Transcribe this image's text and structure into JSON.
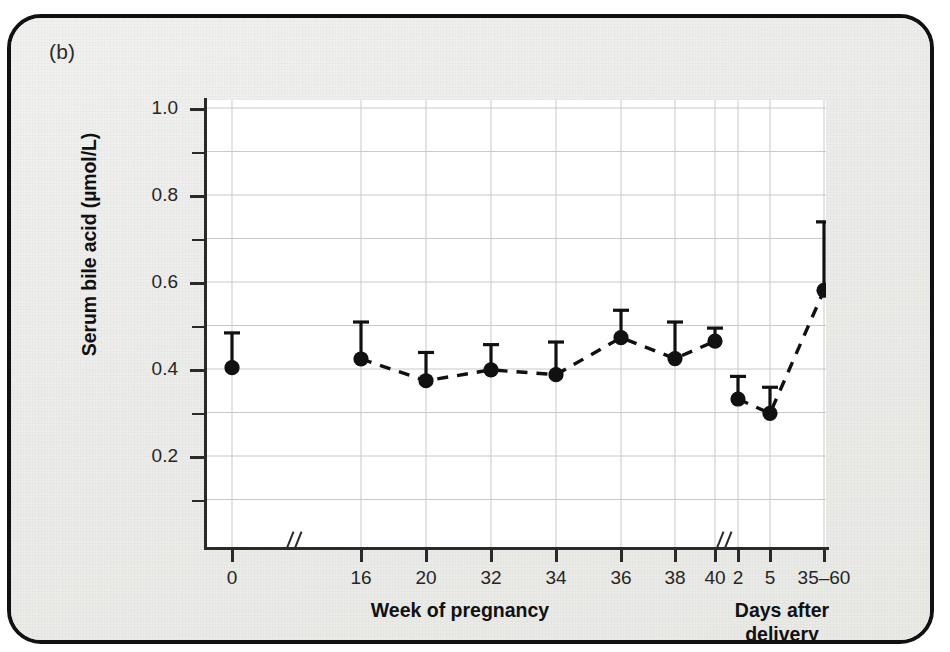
{
  "figure": {
    "panel_label": "(b)",
    "background_color": "#eeeeec",
    "border_color": "#111111"
  },
  "chart_data": {
    "type": "line",
    "title": "",
    "subtitle": "",
    "xlabel_left": "Week of pregnancy",
    "xlabel_right": "Days after delivery",
    "ylabel": "Serum bile acid (µmol/L)",
    "ylim": [
      0.0,
      1.0
    ],
    "ytick_labels": [
      "0.2",
      "0.4",
      "0.6",
      "0.8",
      "1.0"
    ],
    "ytick_values": [
      0.2,
      0.4,
      0.6,
      0.8,
      1.0
    ],
    "yminor_values": [
      0.1,
      0.3,
      0.5,
      0.7,
      0.9
    ],
    "grid": true,
    "legend": "none",
    "axis_breaks": [
      "after week 0",
      "between week 40 and day 2"
    ],
    "error_bars": "upper only (mean + SEM)",
    "marker": "filled circle",
    "line_style": "dashed",
    "categories": [
      "0",
      "16",
      "20",
      "32",
      "34",
      "36",
      "38",
      "40",
      "2",
      "5",
      "35–60"
    ],
    "groups": [
      {
        "name": "Week of pregnancy",
        "categories": [
          "0",
          "16",
          "20",
          "32",
          "34",
          "36",
          "38",
          "40"
        ]
      },
      {
        "name": "Days after delivery",
        "categories": [
          "2",
          "5",
          "35–60"
        ]
      }
    ],
    "values": [
      0.403,
      0.423,
      0.373,
      0.398,
      0.387,
      0.472,
      0.424,
      0.464,
      0.331,
      0.298,
      0.581
    ],
    "error_upper": [
      0.483,
      0.508,
      0.438,
      0.456,
      0.462,
      0.535,
      0.508,
      0.494,
      0.383,
      0.358,
      0.738
    ],
    "connected_segments": [
      [
        1,
        2,
        3,
        4,
        5,
        6,
        7
      ],
      [
        8,
        9,
        10
      ]
    ],
    "points": [
      {
        "category": "0",
        "value": 0.403,
        "upper": 0.483,
        "group": "week"
      },
      {
        "category": "16",
        "value": 0.423,
        "upper": 0.508,
        "group": "week"
      },
      {
        "category": "20",
        "value": 0.373,
        "upper": 0.438,
        "group": "week"
      },
      {
        "category": "32",
        "value": 0.398,
        "upper": 0.456,
        "group": "week"
      },
      {
        "category": "34",
        "value": 0.387,
        "upper": 0.462,
        "group": "week"
      },
      {
        "category": "36",
        "value": 0.472,
        "upper": 0.535,
        "group": "week"
      },
      {
        "category": "38",
        "value": 0.424,
        "upper": 0.508,
        "group": "week"
      },
      {
        "category": "40",
        "value": 0.464,
        "upper": 0.494,
        "group": "week"
      },
      {
        "category": "2",
        "value": 0.331,
        "upper": 0.383,
        "group": "day"
      },
      {
        "category": "5",
        "value": 0.298,
        "upper": 0.358,
        "group": "day"
      },
      {
        "category": "35–60",
        "value": 0.581,
        "upper": 0.738,
        "group": "day"
      }
    ]
  },
  "colors": {
    "marker": "#111111",
    "grid": "#c9c9c9",
    "axis": "#2a2a2a",
    "plot_background": "#ffffff"
  }
}
